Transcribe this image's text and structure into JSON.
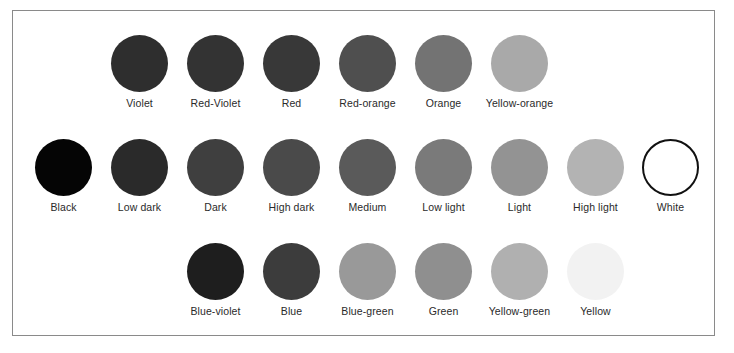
{
  "diagram": {
    "rows": [
      {
        "name": "hues-warm",
        "start_column": 1,
        "swatches": [
          {
            "label": "Violet",
            "color": "#2e2e2e"
          },
          {
            "label": "Red-Violet",
            "color": "#333333"
          },
          {
            "label": "Red",
            "color": "#383838"
          },
          {
            "label": "Red-orange",
            "color": "#4f4f4f"
          },
          {
            "label": "Orange",
            "color": "#737373"
          },
          {
            "label": "Yellow-orange",
            "color": "#a9a9a9"
          }
        ]
      },
      {
        "name": "value-scale",
        "start_column": 0,
        "swatches": [
          {
            "label": "Black",
            "color": "#050505"
          },
          {
            "label": "Low dark",
            "color": "#2a2a2a"
          },
          {
            "label": "Dark",
            "color": "#3f3f3f"
          },
          {
            "label": "High dark",
            "color": "#4a4a4a"
          },
          {
            "label": "Medium",
            "color": "#5a5a5a"
          },
          {
            "label": "Low light",
            "color": "#7a7a7a"
          },
          {
            "label": "Light",
            "color": "#939393"
          },
          {
            "label": "High light",
            "color": "#b3b3b3"
          },
          {
            "label": "White",
            "color": "#ffffff",
            "outlined": true
          }
        ]
      },
      {
        "name": "hues-cool",
        "start_column": 2,
        "swatches": [
          {
            "label": "Blue-violet",
            "color": "#1e1e1e"
          },
          {
            "label": "Blue",
            "color": "#3c3c3c"
          },
          {
            "label": "Blue-green",
            "color": "#999999"
          },
          {
            "label": "Green",
            "color": "#8f8f8f"
          },
          {
            "label": "Yellow-green",
            "color": "#b0b0b0"
          },
          {
            "label": "Yellow",
            "color": "#f2f2f2"
          }
        ]
      }
    ]
  }
}
